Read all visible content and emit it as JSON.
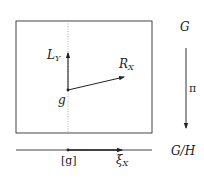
{
  "diagram": {
    "space_label": "G",
    "quotient_label": "G/H",
    "projection_label": "π",
    "point_label": "g",
    "class_label": "[g]",
    "left_vector_label": {
      "base": "L",
      "sub": "Y"
    },
    "right_vector_label": {
      "base": "R",
      "sub": "X"
    },
    "induced_vector_label": {
      "base": "ξ",
      "sub": "X"
    },
    "colors": {
      "stroke": "#333333",
      "dotted": "#888888",
      "background": "#ffffff"
    }
  }
}
